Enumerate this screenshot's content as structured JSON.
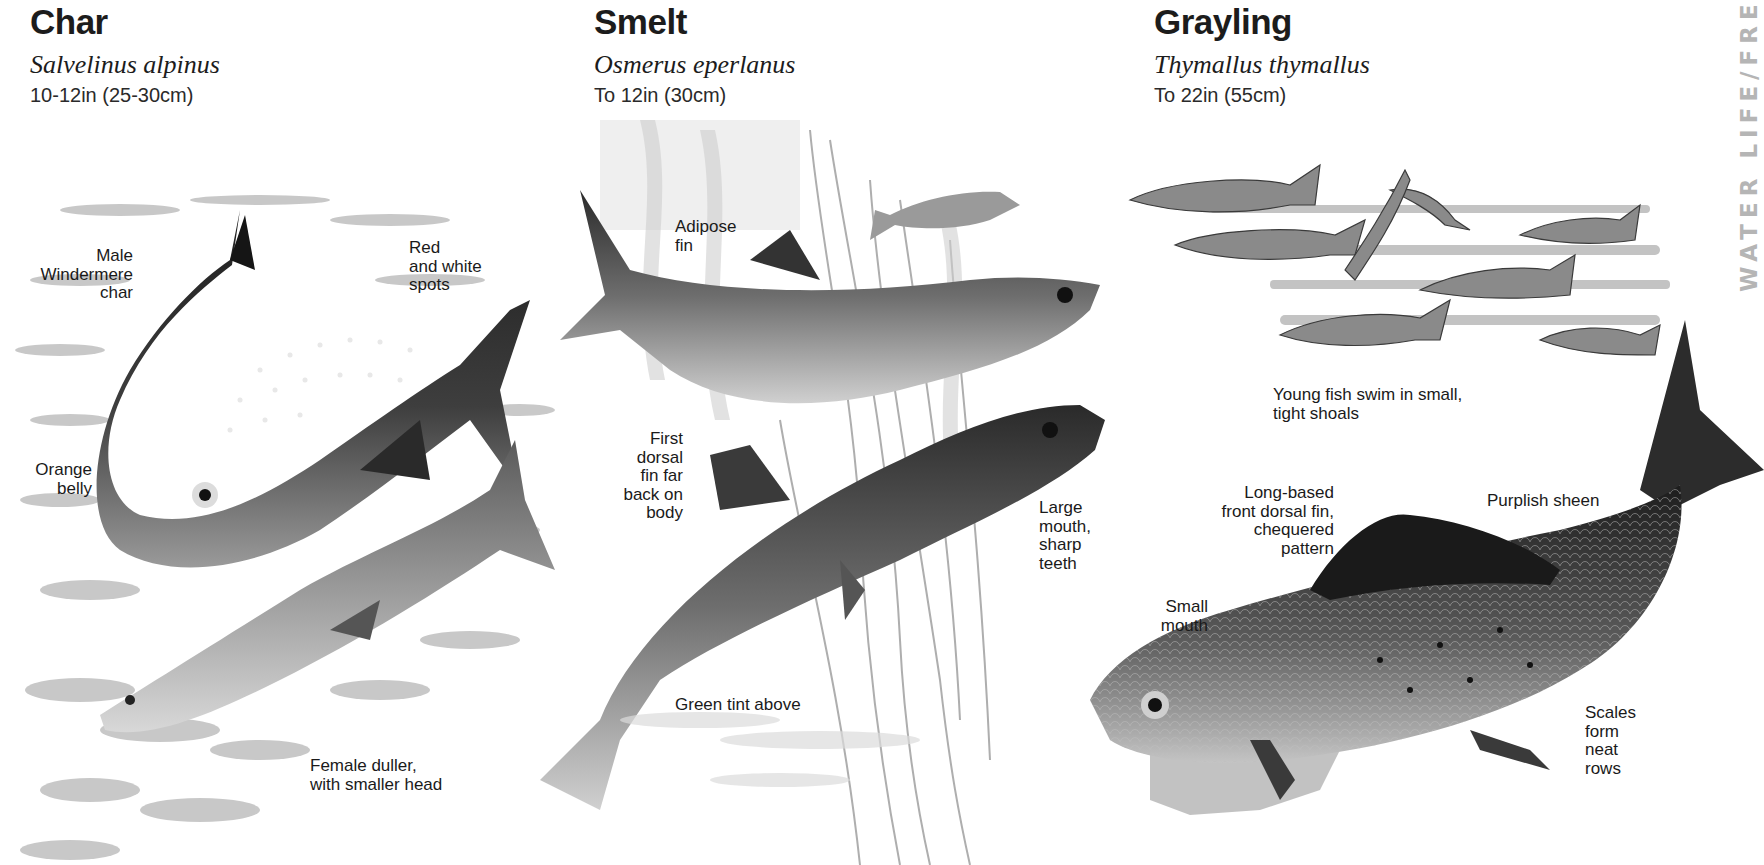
{
  "species": [
    {
      "common_name": "Char",
      "latin_name": "Salvelinus alpinus",
      "size": "10-12in (25-30cm)",
      "labels": {
        "male": "Male\nWindermere\nchar",
        "spots": "Red\nand white\nspots",
        "belly": "Orange\nbelly",
        "female": "Female duller,\nwith smaller head"
      }
    },
    {
      "common_name": "Smelt",
      "latin_name": "Osmerus eperlanus",
      "size": "To 12in (30cm)",
      "labels": {
        "adipose": "Adipose\nfin",
        "dorsal": "First\ndorsal\nfin far\nback on\nbody",
        "mouth": "Large\nmouth,\nsharp\nteeth",
        "tint": "Green tint above"
      }
    },
    {
      "common_name": "Grayling",
      "latin_name": "Thymallus thymallus",
      "size": "To 22in (55cm)",
      "labels": {
        "shoals": "Young fish swim in small,\ntight shoals",
        "dorsal": "Long-based\nfront dorsal fin,\nchequered\npattern",
        "sheen": "Purplish sheen",
        "mouth": "Small\nmouth",
        "scales": "Scales\nform\nneat\nrows"
      }
    }
  ],
  "side_banner": "WATER LIFE/FRE",
  "colors": {
    "background": "#ffffff",
    "text": "#1a1a1a",
    "banner": "#b5b5b5",
    "fish_dark": "#2b2b2b",
    "fish_mid": "#7a7a7a",
    "fish_light": "#c8c8c8"
  }
}
